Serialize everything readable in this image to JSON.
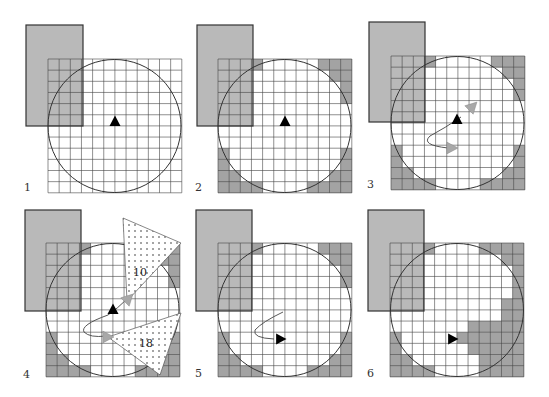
{
  "figure": {
    "grid_size": 12,
    "colors": {
      "background": "#ffffff",
      "rect_fill": "#b9b9b9",
      "rect_stroke": "#333333",
      "shaded_cell": "#a3a3a3",
      "grid_line": "#444444",
      "circle_stroke": "#333333",
      "agent": "#000000",
      "ghost_arrow": "#a8a8a8",
      "dotted_fill": "#ffffff",
      "dot_color": "#333333"
    },
    "panels": [
      {
        "label": "1",
        "label_pos": [
          24,
          191
        ],
        "grid_origin": [
          48,
          59
        ],
        "cell": 11.15,
        "rect": [
          26,
          25,
          57,
          101
        ],
        "circle": [
          114.5,
          126,
          66.5
        ],
        "shaded": [],
        "agent": {
          "x": 115,
          "y": 122,
          "dir": "up"
        },
        "path": null,
        "ghosts": [],
        "triangles": []
      },
      {
        "label": "2",
        "label_pos": [
          195,
          191
        ],
        "grid_origin": [
          218,
          59
        ],
        "cell": 11.15,
        "rect": [
          197,
          25,
          56,
          101
        ],
        "circle": [
          284.5,
          126,
          66.5
        ],
        "shaded": [
          [
            0,
            0
          ],
          [
            0,
            1
          ],
          [
            0,
            2
          ],
          [
            0,
            3
          ],
          [
            0,
            9
          ],
          [
            0,
            10
          ],
          [
            0,
            11
          ],
          [
            1,
            0
          ],
          [
            1,
            1
          ],
          [
            1,
            2
          ],
          [
            1,
            10
          ],
          [
            1,
            11
          ],
          [
            2,
            0
          ],
          [
            2,
            1
          ],
          [
            2,
            2
          ],
          [
            2,
            11
          ],
          [
            3,
            0
          ],
          [
            3,
            1
          ],
          [
            3,
            2
          ],
          [
            3,
            11
          ],
          [
            4,
            0
          ],
          [
            4,
            1
          ],
          [
            4,
            2
          ],
          [
            5,
            0
          ],
          [
            5,
            1
          ],
          [
            5,
            2
          ],
          [
            8,
            0
          ],
          [
            8,
            11
          ],
          [
            9,
            0
          ],
          [
            9,
            11
          ],
          [
            10,
            0
          ],
          [
            10,
            1
          ],
          [
            10,
            10
          ],
          [
            10,
            11
          ],
          [
            11,
            0
          ],
          [
            11,
            1
          ],
          [
            11,
            2
          ],
          [
            11,
            3
          ],
          [
            11,
            8
          ],
          [
            11,
            9
          ],
          [
            11,
            10
          ],
          [
            11,
            11
          ]
        ],
        "agent": {
          "x": 285,
          "y": 122,
          "dir": "up"
        },
        "path": null,
        "ghosts": [],
        "triangles": []
      },
      {
        "label": "3",
        "label_pos": [
          367,
          188
        ],
        "grid_origin": [
          391,
          56
        ],
        "cell": 11.15,
        "rect": [
          369,
          22,
          56,
          100
        ],
        "circle": [
          457.5,
          123,
          66.5
        ],
        "shaded": [
          [
            0,
            0
          ],
          [
            0,
            1
          ],
          [
            0,
            2
          ],
          [
            0,
            3
          ],
          [
            0,
            9
          ],
          [
            0,
            10
          ],
          [
            0,
            11
          ],
          [
            1,
            0
          ],
          [
            1,
            1
          ],
          [
            1,
            2
          ],
          [
            1,
            10
          ],
          [
            1,
            11
          ],
          [
            2,
            0
          ],
          [
            2,
            1
          ],
          [
            2,
            2
          ],
          [
            2,
            11
          ],
          [
            3,
            0
          ],
          [
            3,
            1
          ],
          [
            3,
            2
          ],
          [
            3,
            11
          ],
          [
            4,
            0
          ],
          [
            4,
            1
          ],
          [
            4,
            2
          ],
          [
            5,
            0
          ],
          [
            5,
            1
          ],
          [
            5,
            2
          ],
          [
            8,
            0
          ],
          [
            8,
            11
          ],
          [
            9,
            0
          ],
          [
            9,
            11
          ],
          [
            10,
            0
          ],
          [
            10,
            1
          ],
          [
            10,
            10
          ],
          [
            10,
            11
          ],
          [
            11,
            0
          ],
          [
            11,
            1
          ],
          [
            11,
            2
          ],
          [
            11,
            3
          ],
          [
            11,
            8
          ],
          [
            11,
            9
          ],
          [
            11,
            10
          ],
          [
            11,
            11
          ]
        ],
        "agent": {
          "x": 457,
          "y": 120,
          "dir": "up"
        },
        "path": "M 461 117 Q 445 128 430 136 Q 420 145 448 148",
        "ghosts": [
          {
            "x": 472,
            "y": 107,
            "dir": "upright"
          },
          {
            "x": 451,
            "y": 148,
            "dir": "right"
          }
        ],
        "triangles": []
      },
      {
        "label": "4",
        "label_pos": [
          23,
          378
        ],
        "grid_origin": [
          46,
          243
        ],
        "cell": 11.15,
        "rect": [
          25,
          210,
          56,
          101
        ],
        "circle": [
          112.5,
          310,
          66.5
        ],
        "shaded": [
          [
            0,
            0
          ],
          [
            0,
            1
          ],
          [
            0,
            2
          ],
          [
            0,
            3
          ],
          [
            0,
            9
          ],
          [
            0,
            10
          ],
          [
            0,
            11
          ],
          [
            1,
            0
          ],
          [
            1,
            1
          ],
          [
            1,
            2
          ],
          [
            1,
            10
          ],
          [
            1,
            11
          ],
          [
            2,
            0
          ],
          [
            2,
            1
          ],
          [
            2,
            2
          ],
          [
            2,
            11
          ],
          [
            3,
            0
          ],
          [
            3,
            1
          ],
          [
            3,
            2
          ],
          [
            3,
            11
          ],
          [
            4,
            0
          ],
          [
            4,
            1
          ],
          [
            4,
            2
          ],
          [
            5,
            0
          ],
          [
            5,
            1
          ],
          [
            5,
            2
          ],
          [
            8,
            0
          ],
          [
            8,
            11
          ],
          [
            9,
            0
          ],
          [
            9,
            11
          ],
          [
            10,
            0
          ],
          [
            10,
            1
          ],
          [
            10,
            10
          ],
          [
            10,
            11
          ],
          [
            11,
            0
          ],
          [
            11,
            1
          ],
          [
            11,
            2
          ],
          [
            11,
            3
          ],
          [
            11,
            8
          ],
          [
            11,
            9
          ],
          [
            11,
            10
          ],
          [
            11,
            11
          ]
        ],
        "agent": {
          "x": 113,
          "y": 310,
          "dir": "up"
        },
        "path": "M 127 299 Q 118 308 108 315 Q 80 325 84 332 Q 90 338 106 336",
        "ghosts": [
          {
            "x": 128,
            "y": 299,
            "dir": "upright"
          },
          {
            "x": 107,
            "y": 337,
            "dir": "right"
          }
        ],
        "triangles": [
          {
            "points": [
              [
                123,
                218
              ],
              [
                181,
                243
              ],
              [
                127,
                301
              ]
            ],
            "label": "10",
            "label_pos": [
              133,
              276
            ]
          },
          {
            "points": [
              [
                108,
                337
              ],
              [
                181,
                313
              ],
              [
                160,
                375
              ]
            ],
            "label": "18",
            "label_pos": [
              139,
              347
            ]
          }
        ]
      },
      {
        "label": "5",
        "label_pos": [
          195,
          377
        ],
        "grid_origin": [
          218,
          243
        ],
        "cell": 11.15,
        "rect": [
          196,
          210,
          56,
          101
        ],
        "circle": [
          284.5,
          310,
          66.5
        ],
        "shaded": [
          [
            0,
            0
          ],
          [
            0,
            1
          ],
          [
            0,
            2
          ],
          [
            0,
            3
          ],
          [
            0,
            9
          ],
          [
            0,
            10
          ],
          [
            0,
            11
          ],
          [
            1,
            0
          ],
          [
            1,
            1
          ],
          [
            1,
            2
          ],
          [
            1,
            10
          ],
          [
            1,
            11
          ],
          [
            2,
            0
          ],
          [
            2,
            1
          ],
          [
            2,
            2
          ],
          [
            2,
            11
          ],
          [
            3,
            0
          ],
          [
            3,
            1
          ],
          [
            3,
            2
          ],
          [
            3,
            11
          ],
          [
            4,
            0
          ],
          [
            4,
            1
          ],
          [
            4,
            2
          ],
          [
            5,
            0
          ],
          [
            5,
            1
          ],
          [
            5,
            2
          ],
          [
            8,
            0
          ],
          [
            8,
            11
          ],
          [
            9,
            0
          ],
          [
            9,
            11
          ],
          [
            10,
            0
          ],
          [
            10,
            1
          ],
          [
            10,
            10
          ],
          [
            10,
            11
          ],
          [
            11,
            0
          ],
          [
            11,
            1
          ],
          [
            11,
            2
          ],
          [
            11,
            3
          ],
          [
            11,
            8
          ],
          [
            11,
            9
          ],
          [
            11,
            10
          ],
          [
            11,
            11
          ]
        ],
        "agent": {
          "x": 280,
          "y": 339,
          "dir": "right"
        },
        "path": "M 283 312 Q 262 322 255 330 Q 252 338 274 339",
        "ghosts": [],
        "triangles": []
      },
      {
        "label": "6",
        "label_pos": [
          367,
          377
        ],
        "grid_origin": [
          390,
          243
        ],
        "cell": 11.15,
        "rect": [
          368,
          210,
          56,
          101
        ],
        "circle": [
          457,
          310,
          66.5
        ],
        "shaded": [
          [
            0,
            0
          ],
          [
            0,
            1
          ],
          [
            0,
            2
          ],
          [
            0,
            3
          ],
          [
            0,
            8
          ],
          [
            0,
            9
          ],
          [
            0,
            10
          ],
          [
            0,
            11
          ],
          [
            1,
            0
          ],
          [
            1,
            1
          ],
          [
            1,
            2
          ],
          [
            1,
            10
          ],
          [
            1,
            11
          ],
          [
            2,
            0
          ],
          [
            2,
            1
          ],
          [
            2,
            2
          ],
          [
            2,
            11
          ],
          [
            3,
            0
          ],
          [
            3,
            1
          ],
          [
            3,
            2
          ],
          [
            3,
            11
          ],
          [
            4,
            0
          ],
          [
            4,
            1
          ],
          [
            4,
            2
          ],
          [
            4,
            11
          ],
          [
            5,
            0
          ],
          [
            5,
            1
          ],
          [
            5,
            2
          ],
          [
            5,
            10
          ],
          [
            5,
            11
          ],
          [
            6,
            10
          ],
          [
            6,
            11
          ],
          [
            7,
            7
          ],
          [
            7,
            8
          ],
          [
            7,
            9
          ],
          [
            7,
            10
          ],
          [
            7,
            11
          ],
          [
            8,
            0
          ],
          [
            8,
            6
          ],
          [
            8,
            7
          ],
          [
            8,
            8
          ],
          [
            8,
            9
          ],
          [
            8,
            10
          ],
          [
            8,
            11
          ],
          [
            9,
            0
          ],
          [
            9,
            7
          ],
          [
            9,
            8
          ],
          [
            9,
            9
          ],
          [
            9,
            10
          ],
          [
            9,
            11
          ],
          [
            10,
            0
          ],
          [
            10,
            1
          ],
          [
            10,
            8
          ],
          [
            10,
            9
          ],
          [
            10,
            10
          ],
          [
            10,
            11
          ],
          [
            11,
            0
          ],
          [
            11,
            1
          ],
          [
            11,
            2
          ],
          [
            11,
            3
          ],
          [
            11,
            8
          ],
          [
            11,
            9
          ],
          [
            11,
            10
          ],
          [
            11,
            11
          ]
        ],
        "agent": {
          "x": 452,
          "y": 339,
          "dir": "right"
        },
        "path": null,
        "ghosts": [],
        "triangles": []
      }
    ]
  }
}
